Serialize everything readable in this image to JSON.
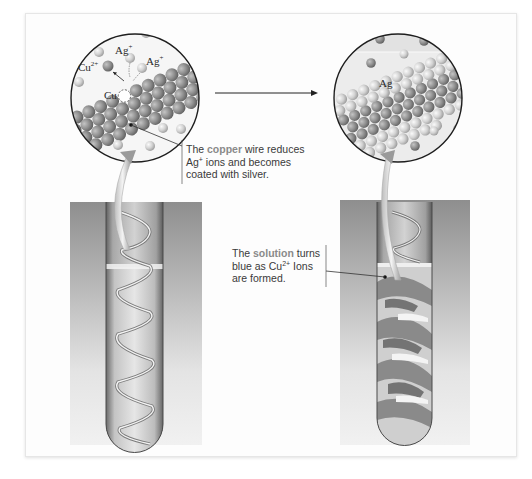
{
  "figure": {
    "left_magnified_view": {
      "labels": {
        "ag_ion_1": "Ag+",
        "ag_ion_2": "Ag+",
        "cu_ion": "Cu2+",
        "cu_metal": "Cu"
      }
    },
    "right_magnified_view": {
      "labels": {
        "ag_metal": "Ag"
      }
    },
    "process_arrow": "right-arrow",
    "annotations": {
      "copper_wire": {
        "prefix": "The ",
        "highlight": "copper",
        "line1_rest": " wire reduces",
        "line2_a": "Ag",
        "line2_sup": "+",
        "line2_b": " ions and becomes",
        "line3": "coated with silver."
      },
      "solution": {
        "prefix": "The ",
        "highlight": "solution",
        "line1_rest": " turns",
        "line2_a": "blue as Cu",
        "line2_sup": "2+",
        "line2_b": " Ions",
        "line3": "are formed."
      }
    },
    "photos": {
      "before": "test-tube-with-copper-coil-clear-solution",
      "after": "test-tube-with-silver-coated-coil-blue-solution"
    },
    "colors": {
      "copper_atom": "#8f8f8f",
      "silver_atom": "#d2d2d2",
      "circle_border": "#1e1e1e",
      "highlight_text": "#8a8a8a",
      "annotation_text": "#3a3a3a"
    }
  }
}
